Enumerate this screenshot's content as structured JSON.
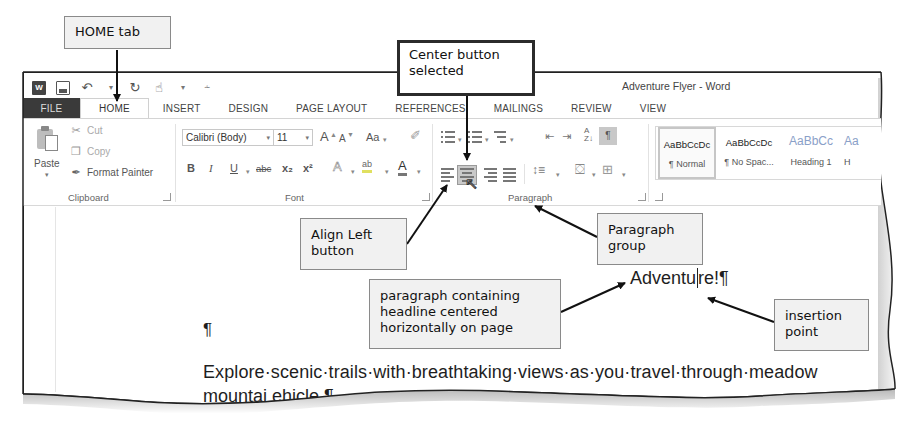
{
  "window": {
    "title": "Adventure Flyer - Word"
  },
  "quick_access_toolbar": {
    "icons": [
      "word-app-icon",
      "save-icon",
      "undo-icon",
      "redo-icon",
      "touch-mode-icon",
      "customize-qat-icon"
    ]
  },
  "tabs": [
    {
      "label": "FILE",
      "active": false
    },
    {
      "label": "HOME",
      "active": true
    },
    {
      "label": "INSERT",
      "active": false
    },
    {
      "label": "DESIGN",
      "active": false
    },
    {
      "label": "PAGE LAYOUT",
      "active": false
    },
    {
      "label": "REFERENCES",
      "active": false
    },
    {
      "label": "MAILINGS",
      "active": false
    },
    {
      "label": "REVIEW",
      "active": false
    },
    {
      "label": "VIEW",
      "active": false
    }
  ],
  "ribbon": {
    "clipboard": {
      "label": "Clipboard",
      "paste": "Paste",
      "cut": "Cut",
      "copy": "Copy",
      "format_painter": "Format Painter"
    },
    "font": {
      "label": "Font",
      "font_name": "Calibri (Body)",
      "font_size": "11",
      "grow": "A",
      "shrink": "A",
      "change_case": "Aa",
      "bold": "B",
      "italic": "I",
      "underline": "U",
      "strikethrough": "abc",
      "subscript": "x₂",
      "superscript": "x²",
      "text_effects": "A",
      "highlight": "ab",
      "font_color": "A"
    },
    "paragraph": {
      "label": "Paragraph",
      "sort": "A↓Z",
      "show_hide": "¶",
      "selected_alignment": "Center"
    },
    "styles": {
      "items": [
        {
          "sample": "AaBbCcDc",
          "name": "¶ Normal",
          "selected": true
        },
        {
          "sample": "AaBbCcDc",
          "name": "¶ No Spac...",
          "selected": false
        },
        {
          "sample": "AaBbCc",
          "name": "Heading 1",
          "selected": false
        },
        {
          "sample": "Aa",
          "name": "H",
          "selected": false
        }
      ]
    }
  },
  "document": {
    "headline_before_caret": "Adventu",
    "headline_after_caret": "re!¶",
    "empty_paragraph": "¶",
    "body_line1": "Explore·scenic·trails·with·breathtaking·views·as·you·travel·through·meadow",
    "body_line2": "mountai                          ehicle.¶"
  },
  "callouts": {
    "home_tab": "HOME tab",
    "center_button": [
      "Center button",
      "selected"
    ],
    "align_left": [
      "Align Left",
      "button"
    ],
    "paragraph_group": [
      "Paragraph",
      "group"
    ],
    "headline_paragraph": [
      "paragraph containing",
      "headline centered",
      "horizontally on page"
    ],
    "insertion_point": [
      "insertion",
      "point"
    ]
  }
}
